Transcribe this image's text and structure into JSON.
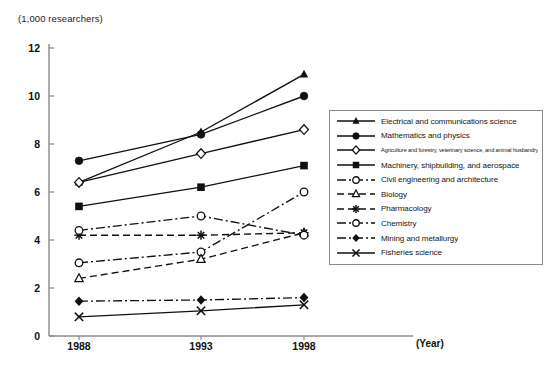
{
  "chart_data": {
    "type": "line",
    "title": "",
    "subtitle": "",
    "ylabel": "(1,000 researchers)",
    "xlabel": "(Year)",
    "categories": [
      "1988",
      "1993",
      "1998"
    ],
    "x": [
      1988,
      1993,
      1998
    ],
    "ylim": [
      0,
      12
    ],
    "yticks": [
      0,
      2,
      4,
      6,
      8,
      10,
      12
    ],
    "ytick_labels": [
      "0",
      "2",
      "4",
      "6",
      "8",
      "10",
      "12"
    ],
    "grid": false,
    "legend_position": "right",
    "series": [
      {
        "name": "Electrical and communications science",
        "values": [
          6.4,
          8.5,
          10.9
        ],
        "marker": "filled-triangle",
        "line": "solid"
      },
      {
        "name": "Mathematics and physics",
        "values": [
          7.3,
          8.4,
          10.0
        ],
        "marker": "filled-circle",
        "line": "solid"
      },
      {
        "name": "Agriculture and forestry, veterinary science, and animal husbandry",
        "values": [
          6.4,
          7.6,
          8.6
        ],
        "marker": "open-diamond",
        "line": "solid"
      },
      {
        "name": "Machinery, shipbuilding, and aerospace",
        "values": [
          5.4,
          6.2,
          7.1
        ],
        "marker": "filled-square",
        "line": "solid"
      },
      {
        "name": "Civil engineering and architecture",
        "values": [
          3.05,
          3.5,
          6.0
        ],
        "marker": "open-circle",
        "line": "dash-dot"
      },
      {
        "name": "Biology",
        "values": [
          2.4,
          3.2,
          4.3
        ],
        "marker": "open-triangle",
        "line": "dashed"
      },
      {
        "name": "Pharmacology",
        "values": [
          4.2,
          4.2,
          4.3
        ],
        "marker": "asterisk",
        "line": "dashed"
      },
      {
        "name": "Chemistry",
        "values": [
          4.4,
          5.0,
          4.2
        ],
        "marker": "open-circle",
        "line": "dash-dot"
      },
      {
        "name": "Mining and metallurgy",
        "values": [
          1.45,
          1.5,
          1.6
        ],
        "marker": "filled-diamond",
        "line": "dash-dot"
      },
      {
        "name": "Fisheries science",
        "values": [
          0.8,
          1.05,
          1.3
        ],
        "marker": "cross",
        "line": "solid"
      }
    ]
  },
  "axes": {
    "unit_label": "(1,000 researchers)",
    "year_caption": "(Year)"
  },
  "legend": {
    "items": [
      {
        "label": "Electrical and communications science",
        "marker": "filled-triangle",
        "line": "solid"
      },
      {
        "label": "Mathematics and physics",
        "marker": "filled-circle",
        "line": "solid"
      },
      {
        "label": "Agriculture and forestry, veterinary science, and animal husbandry",
        "marker": "open-diamond",
        "line": "solid"
      },
      {
        "label": "Machinery, shipbuilding, and aerospace",
        "marker": "filled-square",
        "line": "solid"
      },
      {
        "label": "Civil engineering and architecture",
        "marker": "open-circle",
        "line": "dash-dot"
      },
      {
        "label": "Biology",
        "marker": "open-triangle",
        "line": "dashed"
      },
      {
        "label": "Pharmacology",
        "marker": "asterisk",
        "line": "dashed"
      },
      {
        "label": "Chemistry",
        "marker": "open-circle",
        "line": "dash-dot"
      },
      {
        "label": "Mining and metallurgy",
        "marker": "filled-diamond",
        "line": "dash-dot"
      },
      {
        "label": "Fisheries science",
        "marker": "cross",
        "line": "solid"
      }
    ]
  },
  "colors": {
    "ink": "#111111",
    "axis": "#8a8a8a",
    "background": "#ffffff"
  }
}
